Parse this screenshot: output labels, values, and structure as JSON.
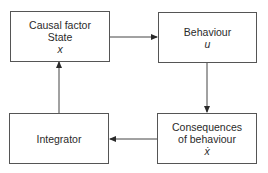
{
  "diagram": {
    "nodes": [
      {
        "id": "causal",
        "lines": [
          "Causal  factor",
          "State"
        ],
        "var": "x"
      },
      {
        "id": "behaviour",
        "lines": [
          "Behaviour"
        ],
        "var": "u"
      },
      {
        "id": "consequences",
        "lines": [
          "Consequences",
          "of  behaviour"
        ],
        "var": "ẋ"
      },
      {
        "id": "integrator",
        "lines": [
          "Integrator"
        ],
        "var": ""
      }
    ],
    "edges": [
      {
        "from": "causal",
        "to": "behaviour"
      },
      {
        "from": "behaviour",
        "to": "consequences"
      },
      {
        "from": "consequences",
        "to": "integrator"
      },
      {
        "from": "integrator",
        "to": "causal"
      }
    ]
  }
}
